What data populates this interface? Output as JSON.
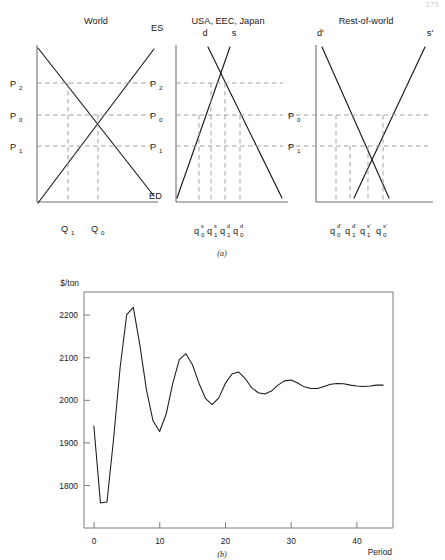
{
  "page": {
    "number": "275"
  },
  "figure_a": {
    "caption": "(a)",
    "panels": [
      {
        "title": "World",
        "curve_labels": [
          "ES",
          "ED"
        ],
        "price_labels": [
          "P2",
          "P0",
          "P1"
        ],
        "price_subscripts": [
          "2",
          "0",
          "1"
        ],
        "quantity_labels": [
          "Q1",
          "Q0"
        ],
        "quantity_subscripts": [
          "1",
          "0"
        ]
      },
      {
        "title": "USA, EEC, Japan",
        "curve_labels": [
          "d",
          "s"
        ],
        "price_labels": [
          "P2",
          "P0",
          "P1"
        ],
        "price_subscripts": [
          "2",
          "0",
          "1"
        ],
        "quantity_bases": [
          "q",
          "q",
          "q",
          "q"
        ],
        "quantity_subscripts": [
          "0",
          "1",
          "1",
          "0"
        ],
        "quantity_superscripts": [
          "s",
          "s",
          "d",
          "d"
        ]
      },
      {
        "title": "Rest-of-world",
        "curve_labels": [
          "d'",
          "s'"
        ],
        "price_labels": [
          "P0",
          "P1"
        ],
        "price_subscripts": [
          "0",
          "1"
        ],
        "quantity_bases": [
          "q",
          "q",
          "q",
          "q"
        ],
        "quantity_subscripts": [
          "0",
          "1",
          "1",
          "0"
        ],
        "quantity_superscripts": [
          "d'",
          "d'",
          "s'",
          "s'"
        ]
      }
    ]
  },
  "chart_data": {
    "type": "line",
    "title": "",
    "caption": "(b)",
    "xlabel": "Period",
    "ylabel": "$/ton",
    "xlim": [
      -1.5,
      45.5
    ],
    "ylim": [
      1720,
      2275
    ],
    "xticks": [
      0,
      10,
      20,
      30,
      40
    ],
    "yticks": [
      1800,
      1900,
      2000,
      2100,
      2200
    ],
    "grid": false,
    "legend": null,
    "series": [
      {
        "name": "price",
        "x": [
          0,
          1,
          2,
          3,
          4,
          5,
          6,
          7,
          8,
          9,
          10,
          11,
          12,
          13,
          14,
          15,
          16,
          17,
          18,
          19,
          20,
          21,
          22,
          23,
          24,
          25,
          26,
          27,
          28,
          29,
          30,
          31,
          32,
          33,
          34,
          35,
          36,
          37,
          38,
          39,
          40,
          41,
          42,
          43,
          44
        ],
        "values": [
          1960,
          1779,
          1781,
          1930,
          2098,
          2222,
          2239,
          2150,
          2045,
          1972,
          1947,
          1988,
          2060,
          2116,
          2130,
          2104,
          2060,
          2024,
          2010,
          2026,
          2060,
          2082,
          2087,
          2072,
          2050,
          2038,
          2035,
          2042,
          2056,
          2066,
          2068,
          2061,
          2052,
          2048,
          2048,
          2053,
          2058,
          2060,
          2059,
          2056,
          2054,
          2053,
          2054,
          2056,
          2056
        ]
      }
    ]
  }
}
